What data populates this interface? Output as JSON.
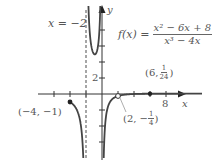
{
  "chart_data": {
    "type": "line",
    "title": "",
    "function": {
      "name": "f(x)",
      "numerator": "x² − 6x + 8",
      "denominator": "x³ − 4x",
      "simplified": "(x − 4) / (x(x + 2)), x ≠ 2"
    },
    "xlabel": "x",
    "ylabel": "y",
    "xlim": [
      -12.75,
      14
    ],
    "ylim": [
      -9,
      11.5
    ],
    "grid": false,
    "x_ticks": [
      -6,
      -4,
      -2,
      2,
      4,
      6,
      8
    ],
    "x_tick_labels": [
      {
        "value": 8,
        "label": "8"
      }
    ],
    "y_ticks": [
      -6,
      -4,
      -2,
      2,
      4,
      6,
      8
    ],
    "y_tick_labels": [
      {
        "value": 2,
        "label": "2"
      }
    ],
    "asymptotes": [
      {
        "type": "vertical",
        "x": -2,
        "label": "x = −2",
        "style": "dashed"
      },
      {
        "type": "vertical",
        "x": 0,
        "style": "axis"
      },
      {
        "type": "horizontal",
        "y": 0,
        "style": "axis"
      }
    ],
    "series": [
      {
        "name": "branch-left",
        "domain": [
          -4,
          -2.07
        ],
        "start_point": {
          "x": -4,
          "y": -1,
          "marker": "filled"
        }
      },
      {
        "name": "branch-middle",
        "domain": [
          -1.9,
          -0.08
        ],
        "local_min": {
          "x": -1,
          "y": 5
        }
      },
      {
        "name": "branch-right",
        "domain": [
          0.08,
          12.5
        ],
        "end_point": {
          "x": 6,
          "y": 0.0417,
          "marker": "filled"
        }
      }
    ],
    "annotations": [
      {
        "point": [
          -4,
          -1
        ],
        "label": "(−4, −1)",
        "marker": "filled"
      },
      {
        "point": [
          2,
          -0.25
        ],
        "label": "(2, −1/4)",
        "marker": "open",
        "note": "hole"
      },
      {
        "point": [
          6,
          0.0417
        ],
        "label": "(6, 1/24)",
        "marker": "filled"
      }
    ]
  },
  "labels": {
    "asymptote": "x = −2",
    "y_axis": "y",
    "x_axis": "x",
    "y_tick_2": "2",
    "x_tick_8": "8",
    "fx": "f(x) =",
    "numerator": "x² − 6x + 8",
    "denominator": "x³ − 4x",
    "point_left": "(−4, −1)",
    "point_hole_prefix": "(2, −",
    "point_hole_num": "1",
    "point_hole_den": "4",
    "point_hole_suffix": ")",
    "point_right_prefix": "(6, ",
    "point_right_num": "1",
    "point_right_den": "24",
    "point_right_suffix": ")"
  }
}
